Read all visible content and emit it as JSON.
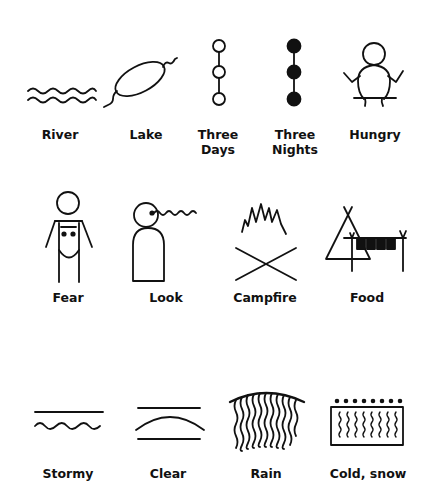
{
  "rows": [
    {
      "symbols": [
        {
          "id": "river",
          "label": "River",
          "icon": "river-icon"
        },
        {
          "id": "lake",
          "label": "Lake",
          "icon": "lake-icon"
        },
        {
          "id": "three-days",
          "label_line1": "Three",
          "label_line2": "Days",
          "icon": "three-days-icon"
        },
        {
          "id": "three-nights",
          "label_line1": "Three",
          "label_line2": "Nights",
          "icon": "three-nights-icon"
        },
        {
          "id": "hungry",
          "label": "Hungry",
          "icon": "hungry-icon"
        }
      ]
    },
    {
      "symbols": [
        {
          "id": "fear",
          "label": "Fear",
          "icon": "fear-icon"
        },
        {
          "id": "look",
          "label": "Look",
          "icon": "look-icon"
        },
        {
          "id": "campfire",
          "label": "Campfire",
          "icon": "campfire-icon"
        },
        {
          "id": "food",
          "label": "Food",
          "icon": "food-icon"
        }
      ]
    },
    {
      "symbols": [
        {
          "id": "stormy",
          "label": "Stormy",
          "icon": "stormy-icon"
        },
        {
          "id": "clear",
          "label": "Clear",
          "icon": "clear-icon"
        },
        {
          "id": "rain",
          "label": "Rain",
          "icon": "rain-icon"
        },
        {
          "id": "cold-snow",
          "label": "Cold, snow",
          "icon": "cold-snow-icon"
        }
      ]
    }
  ],
  "colors": {
    "ink": "#111111",
    "background": "#ffffff"
  }
}
